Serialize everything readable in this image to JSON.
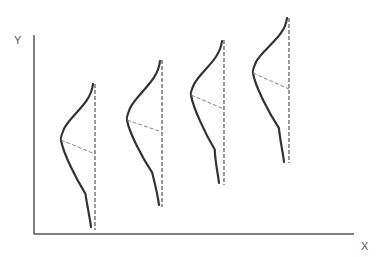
{
  "diagram": {
    "type": "shifting-distributions",
    "axes": {
      "x_label": "X",
      "y_label": "Y",
      "origin": [
        34,
        234
      ],
      "y_axis_top": 35,
      "x_axis_right": 354,
      "color": "#555555"
    },
    "curve_color": "#333333",
    "dash_color": "#555555",
    "distributions": [
      {
        "baseline_x": 95,
        "top_y": 84,
        "bottom_y": 230,
        "peak": [
          61,
          140
        ],
        "mean_mark_y": 154,
        "curve_top": [
          93,
          84
        ],
        "curve_bottom": [
          91,
          227
        ]
      },
      {
        "baseline_x": 162,
        "top_y": 60,
        "bottom_y": 207,
        "peak": [
          127,
          120
        ],
        "mean_mark_y": 132,
        "curve_top": [
          160,
          61
        ],
        "curve_bottom": [
          159,
          205
        ]
      },
      {
        "baseline_x": 224,
        "top_y": 40,
        "bottom_y": 185,
        "peak": [
          191,
          95
        ],
        "mean_mark_y": 109,
        "curve_top": [
          222,
          41
        ],
        "curve_bottom": [
          219,
          183
        ]
      },
      {
        "baseline_x": 289,
        "top_y": 18,
        "bottom_y": 163,
        "peak": [
          253,
          73
        ],
        "mean_mark_y": 89,
        "curve_top": [
          287,
          18
        ],
        "curve_bottom": [
          284,
          162
        ]
      }
    ]
  }
}
